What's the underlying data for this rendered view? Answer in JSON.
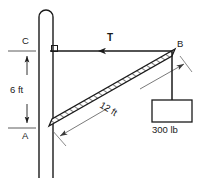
{
  "figure": {
    "background": "#ffffff",
    "line_color": "#1a1a1a",
    "hatch_color": "#3a3a3a",
    "dim_color": "#6b6b6b",
    "width": 199,
    "height": 178
  },
  "labels": {
    "point_c": "C",
    "point_a": "A",
    "point_b": "B",
    "tension": "T",
    "vertical_dimension": "6 ft",
    "boom_dimension": "12 ft",
    "load": "300 lb"
  },
  "elements": {
    "pole": {
      "name": "vertical-pole",
      "x_left": 39,
      "x_right": 53,
      "y_top": 10,
      "y_bottom": 178,
      "rounded_top": true
    },
    "cable": {
      "name": "horizontal-cable-cb",
      "from": "C",
      "to": "B",
      "x1": 50,
      "y1": 51,
      "x2": 172,
      "y2": 51,
      "arrow": "left",
      "force_label": "T"
    },
    "boom": {
      "name": "diagonal-boom-ab",
      "from": "A",
      "to": "B",
      "x1": 50,
      "y1": 123,
      "x2": 172,
      "y2": 51,
      "hatched": true,
      "length_label": "12 ft"
    },
    "right_angle_marker": {
      "name": "right-angle-symbol",
      "x": 51,
      "y": 51
    },
    "dimension_vertical": {
      "name": "dimension-6ft",
      "x": 27,
      "y_top": 51,
      "y_bottom": 128,
      "label": "6 ft",
      "tick_top_label": "C",
      "tick_bottom_label": "A"
    },
    "dimension_boom": {
      "name": "dimension-12ft",
      "label": "12 ft",
      "x1": 57,
      "y1": 139,
      "x2": 186,
      "y2": 63
    },
    "rope": {
      "name": "vertical-rope",
      "x": 172,
      "y_top": 51,
      "y_bottom": 100
    },
    "weight_box": {
      "name": "hanging-weight-box",
      "x": 152,
      "y": 100,
      "width": 40,
      "height": 22,
      "label": "300 lb"
    }
  }
}
